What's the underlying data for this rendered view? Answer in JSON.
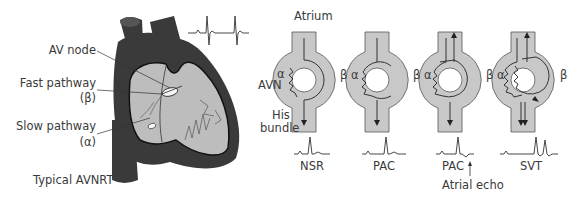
{
  "heart_panel": {
    "labels": {
      "av_node": "AV node",
      "fast_pathway": "Fast pathway",
      "fast_symbol": "(β)",
      "slow_pathway": "Slow pathway",
      "slow_symbol": "(α)",
      "caption": "Typical AVNRT"
    }
  },
  "schematic_panel": {
    "atrium_label": "Atrium",
    "avn_label": "AVN",
    "his_label": "His",
    "bundle_label": "bundle",
    "alpha": "α",
    "beta": "β",
    "panels": [
      {
        "caption": "NSR"
      },
      {
        "caption": "PAC"
      },
      {
        "caption": "PAC"
      },
      {
        "caption": "SVT"
      }
    ],
    "atrial_echo_label": "Atrial echo"
  },
  "colors": {
    "heart_dark": "#3a3a3a",
    "heart_light": "#bdbdbd",
    "node_fill": "#c8c8c8",
    "line": "#222222"
  }
}
